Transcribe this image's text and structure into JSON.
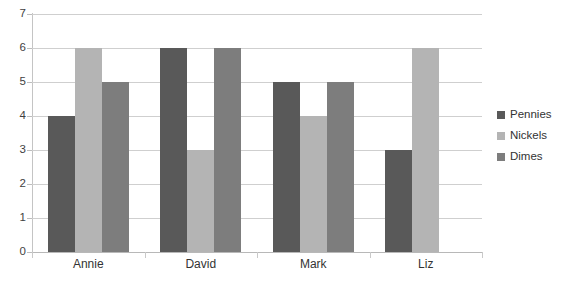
{
  "chart_data": {
    "type": "bar",
    "title": "",
    "xlabel": "",
    "ylabel": "",
    "ylim": [
      0,
      7
    ],
    "ytick_step": 1,
    "yticks": [
      "7",
      "6",
      "5",
      "4",
      "3",
      "2",
      "1",
      "0"
    ],
    "grid": true,
    "legend_position": "right",
    "categories": [
      "Annie",
      "David",
      "Mark",
      "Liz"
    ],
    "series": [
      {
        "name": "Pennies",
        "color": "#595959",
        "values": [
          4,
          6,
          5,
          3
        ]
      },
      {
        "name": "Nickels",
        "color": "#b4b4b4",
        "values": [
          6,
          3,
          4,
          6
        ]
      },
      {
        "name": "Dimes",
        "color": "#7d7d7d",
        "values": [
          5,
          6,
          5,
          0
        ]
      }
    ]
  },
  "legend": {
    "items": [
      {
        "label": "Pennies"
      },
      {
        "label": "Nickels"
      },
      {
        "label": "Dimes"
      }
    ]
  },
  "axis": {
    "y_labels": [
      "7",
      "6",
      "5",
      "4",
      "3",
      "2",
      "1",
      "0"
    ],
    "x_labels": [
      "Annie",
      "David",
      "Mark",
      "Liz"
    ]
  },
  "header": {
    "clipped_text": ""
  }
}
